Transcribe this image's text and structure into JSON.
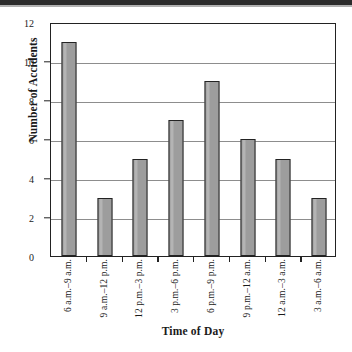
{
  "chart_data": {
    "type": "bar",
    "title": "",
    "xlabel": "Time of Day",
    "ylabel": "Number of Accidents",
    "categories": [
      "6 a.m.–9 a.m.",
      "9 a.m.–12 p.m.",
      "12 p.m.–3 p.m.",
      "3 p.m.–6 p.m.",
      "6 p.m.–9 p.m.",
      "9 p.m.–12 a.m.",
      "12 a.m.–3 a.m.",
      "3 a.m.–6 a.m."
    ],
    "values": [
      11,
      3,
      5,
      7,
      9,
      6,
      5,
      3
    ],
    "ylim": [
      0,
      12
    ],
    "ytick_labels": [
      "12",
      "10",
      "8",
      "6",
      "4",
      "2",
      "0"
    ],
    "ytick_values": [
      12,
      10,
      8,
      6,
      4,
      2,
      0
    ],
    "ytick_step": 2,
    "grid": "horizontal",
    "legend": "none",
    "bar_color": "#9d9d9d",
    "bar_edge_color": "#232323",
    "grid_color": "#8d8d8d",
    "axis_color": "#222222",
    "background": "#ffffff"
  }
}
